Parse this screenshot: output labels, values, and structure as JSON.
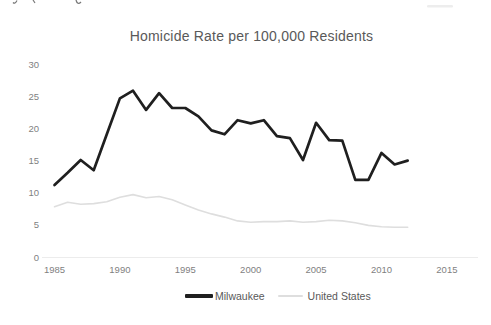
{
  "chart_data": {
    "type": "line",
    "title": "Homicide Rate per 100,000 Residents",
    "xlabel": "",
    "ylabel": "",
    "xlim": [
      1985,
      2015
    ],
    "ylim": [
      0,
      30
    ],
    "grid": false,
    "legend_position": "bottom-center",
    "xticks": [
      1985,
      1990,
      1995,
      2000,
      2005,
      2010,
      2015
    ],
    "yticks": [
      0,
      5,
      10,
      15,
      20,
      25,
      30
    ],
    "x": [
      1985,
      1986,
      1987,
      1988,
      1989,
      1990,
      1991,
      1992,
      1993,
      1994,
      1995,
      1996,
      1997,
      1998,
      1999,
      2000,
      2001,
      2002,
      2003,
      2004,
      2005,
      2006,
      2007,
      2008,
      2009,
      2010,
      2011,
      2012
    ],
    "series": [
      {
        "name": "Milwaukee",
        "color": "#1f1f1f",
        "stroke_width": 2.7,
        "values": [
          11.3,
          13.2,
          15.2,
          13.6,
          19.2,
          24.8,
          26.0,
          23.0,
          25.6,
          23.3,
          23.3,
          22.0,
          19.8,
          19.2,
          21.4,
          20.9,
          21.4,
          18.9,
          18.6,
          15.2,
          21.0,
          18.3,
          18.2,
          12.1,
          12.1,
          16.3,
          14.5,
          15.1
        ]
      },
      {
        "name": "United States",
        "color": "#dedede",
        "stroke_width": 1.6,
        "values": [
          7.9,
          8.6,
          8.3,
          8.4,
          8.7,
          9.4,
          9.8,
          9.3,
          9.5,
          9.0,
          8.2,
          7.4,
          6.8,
          6.3,
          5.7,
          5.5,
          5.6,
          5.6,
          5.7,
          5.5,
          5.6,
          5.8,
          5.7,
          5.4,
          5.0,
          4.8,
          4.7,
          4.7
        ]
      }
    ],
    "axis_line_color": "#ececec",
    "title_color": "#595959",
    "tick_color": "#7f7f7f"
  }
}
